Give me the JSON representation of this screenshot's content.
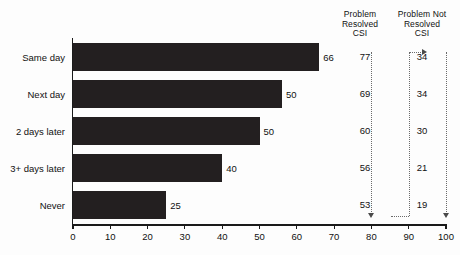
{
  "chart_data": {
    "type": "bar",
    "title": "",
    "subtitle": "",
    "xlabel": "",
    "ylabel": "",
    "orientation": "horizontal",
    "grid": false,
    "legend_position": "none",
    "xlim": [
      0,
      100
    ],
    "xticks": [
      0,
      10,
      20,
      30,
      40,
      50,
      60,
      70,
      80,
      90,
      100
    ],
    "xtick_labels": [
      "0",
      "10",
      "20",
      "30",
      "40",
      "50",
      "60",
      "70",
      "80",
      "90",
      "100"
    ],
    "categories": [
      "Same day",
      "Next day",
      "2 days later",
      "3+ days later",
      "Never"
    ],
    "values": [
      66,
      50,
      50,
      40,
      25
    ],
    "value_labels": [
      "66",
      "50",
      "50",
      "40",
      "25"
    ],
    "bar_lengths_drawn": [
      66,
      56,
      50,
      40,
      25
    ],
    "bar_color": "#231f20",
    "series": [
      {
        "name": "Percent",
        "values": [
          66,
          50,
          50,
          40,
          25
        ]
      },
      {
        "name": "Problem Resolved CSI",
        "values": [
          77,
          69,
          60,
          56,
          53
        ]
      },
      {
        "name": "Problem Not Resolved CSI",
        "values": [
          34,
          34,
          30,
          21,
          19
        ]
      }
    ],
    "columns": {
      "resolved": {
        "header_line1": "Problem",
        "header_line2": "Resolved",
        "header_line3": "CSI",
        "values": [
          "77",
          "69",
          "60",
          "56",
          "53"
        ]
      },
      "not_resolved": {
        "header_line1": "Problem Not",
        "header_line2": "Resolved",
        "header_line3": "CSI",
        "values": [
          "34",
          "34",
          "30",
          "21",
          "19"
        ]
      }
    },
    "annotations": {
      "guides": [
        {
          "name": "guide-80",
          "x": 80,
          "arrow": "down"
        },
        {
          "name": "guide-90",
          "x": 90,
          "arrow": "right"
        },
        {
          "name": "guide-100",
          "x": 100,
          "arrow": "down"
        }
      ]
    }
  }
}
